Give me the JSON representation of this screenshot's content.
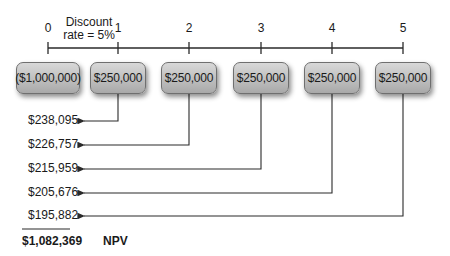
{
  "diagram": {
    "discount_rate_label": "Discount rate = 5%",
    "discount_rate_line1": "Discount",
    "discount_rate_line2": "rate = 5%",
    "periods": [
      {
        "label": "0",
        "cash_flow": "($1,000,000)"
      },
      {
        "label": "1",
        "cash_flow": "$250,000"
      },
      {
        "label": "2",
        "cash_flow": "$250,000"
      },
      {
        "label": "3",
        "cash_flow": "$250,000"
      },
      {
        "label": "4",
        "cash_flow": "$250,000"
      },
      {
        "label": "5",
        "cash_flow": "$250,000"
      }
    ],
    "present_values": [
      "$238,095",
      "$226,757",
      "$215,959",
      "$205,676",
      "$195,882"
    ],
    "npv_value": "$1,082,369",
    "npv_label": "NPV",
    "colors": {
      "box_top": "#d8d8d8",
      "box_bottom": "#a9a9a9",
      "line": "#2a2a2a",
      "text": "#1a1a1a"
    }
  }
}
